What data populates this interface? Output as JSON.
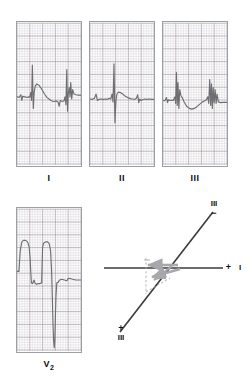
{
  "figure": {
    "type": "ecg-leads-with-axis-vector-diagram",
    "background": "#ffffff",
    "grid_color_fine": "#c9c2c6",
    "grid_color_bold": "#9b9399",
    "trace_color": "#6e6e72",
    "axis_color": "#3a3a3a",
    "vector_color": "#a8a8ac"
  },
  "panels": [
    {
      "id": "lead-I",
      "label": "I",
      "x": 16,
      "y": 21,
      "w": 66,
      "h": 146,
      "baseline_ratio": 0.52,
      "trace": "M0,0.52 L0.035,0.523 L0.06,0.505 L0.075,0.545 L0.09,0.515 L0.115,0.52 L0.135,0.52 L0.155,0.525 L0.175,0.52 L0.2,0.522 L0.215,0.49 L0.228,0.545 L0.24,0.30 L0.255,0.60 L0.268,0.49 L0.285,0.445 L0.31,0.43 L0.345,0.44 L0.385,0.465 L0.43,0.50 L0.47,0.525 L0.50,0.535 L0.53,0.545 L0.56,0.55 L0.59,0.552 L0.615,0.548 L0.64,0.555 L0.66,0.585 L0.675,0.545 L0.695,0.55 L0.715,0.55 L0.735,0.548 L0.75,0.52 L0.765,0.575 L0.778,0.33 L0.79,0.62 L0.80,0.50 L0.815,0.455 L0.828,0.52 L0.84,0.42 L0.855,0.535 L0.87,0.47 L0.89,0.50 L0.92,0.505 L0.96,0.508 L1.0,0.508"
    },
    {
      "id": "lead-II",
      "label": "II",
      "x": 89,
      "y": 21,
      "w": 66,
      "h": 146,
      "baseline_ratio": 0.52,
      "trace": "M0,0.535 L0.04,0.537 L0.07,0.53 L0.095,0.50 L0.115,0.545 L0.14,0.537 L0.175,0.535 L0.21,0.537 L0.245,0.535 L0.275,0.537 L0.30,0.53 L0.325,0.535 L0.345,0.50 L0.36,0.555 L0.375,0.29 L0.39,0.70 L0.405,0.55 L0.42,0.50 L0.445,0.487 L0.475,0.49 L0.51,0.50 L0.55,0.515 L0.59,0.525 L0.63,0.532 L0.665,0.535 L0.70,0.537 L0.725,0.53 L0.745,0.505 L0.762,0.56 L0.775,0.535 L0.80,0.545 L0.825,0.538 L0.855,0.535 L0.89,0.537 L0.93,0.535 L0.97,0.537 L1.0,0.537"
    },
    {
      "id": "lead-III",
      "label": "III",
      "x": 162,
      "y": 21,
      "w": 66,
      "h": 146,
      "baseline_ratio": 0.52,
      "trace": "M0,0.545 L0.03,0.547 L0.055,0.525 L0.07,0.56 L0.085,0.54 L0.11,0.545 L0.135,0.543 L0.16,0.545 L0.185,0.52 L0.198,0.565 L0.21,0.35 L0.222,0.58 L0.234,0.42 L0.248,0.60 L0.262,0.47 L0.28,0.51 L0.30,0.525 L0.33,0.555 L0.37,0.585 L0.41,0.60 L0.45,0.605 L0.49,0.60 L0.53,0.588 L0.57,0.572 L0.61,0.558 L0.645,0.548 L0.675,0.542 L0.70,0.52 L0.715,0.565 L0.73,0.40 L0.745,0.58 L0.758,0.43 L0.772,0.60 L0.785,0.455 L0.80,0.56 L0.815,0.47 L0.83,0.565 L0.845,0.50 L0.865,0.555 L0.90,0.56 L0.94,0.558 L1.0,0.558"
    },
    {
      "id": "lead-V2",
      "label": "V",
      "label_sub": "2",
      "x": 16,
      "y": 207,
      "w": 66,
      "h": 146,
      "baseline_ratio": 0.52,
      "trace": "M0.0,0.44 L0.03,0.44 L0.05,0.30 L0.075,0.235 L0.10,0.225 L0.135,0.225 L0.165,0.235 L0.19,0.27 L0.205,0.35 L0.215,0.445 L0.225,0.52 L0.245,0.525 L0.265,0.50 L0.285,0.525 L0.305,0.53 L0.33,0.525 L0.36,0.525 L0.385,0.52 L0.40,0.27 L0.415,0.245 L0.445,0.235 L0.48,0.235 L0.505,0.25 L0.525,0.30 L0.54,0.43 L0.552,0.62 L0.562,0.80 L0.572,0.92 L0.582,0.97 L0.592,0.90 L0.60,0.75 L0.61,0.60 L0.622,0.52 L0.645,0.515 L0.665,0.50 L0.70,0.495 L0.74,0.50 L0.78,0.505 L0.80,0.488 L0.83,0.49 L0.87,0.495 L0.92,0.50 L1.0,0.50"
    }
  ],
  "vector_diagram": {
    "id": "axis-vector-diagram",
    "x": 104,
    "y": 200,
    "w": 143,
    "h": 158,
    "lead_I_axis": {
      "label": "I",
      "sign": "+",
      "sign_position": "right",
      "orientation": "horizontal"
    },
    "lead_III_axis": {
      "label_top": "III",
      "sign_top": "−",
      "label_bottom": "III",
      "sign_bottom": "+",
      "orientation": "diagonal"
    },
    "vectors": [
      {
        "name": "lead-I-component-arrow",
        "direction": "leftward"
      },
      {
        "name": "lead-III-component-arrow",
        "direction": "down-left"
      },
      {
        "name": "mean-qrs-resultant-arrow",
        "direction": "left-and-slightly-down"
      }
    ],
    "construction_lines": "dashed perpendicular projection lines"
  }
}
